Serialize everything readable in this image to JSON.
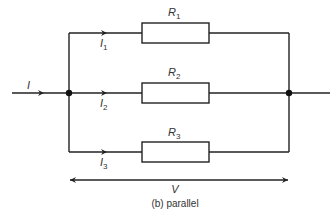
{
  "diagram": {
    "caption": "(b) parallel",
    "input_current": "I",
    "voltage": "V",
    "branches": [
      {
        "resistor": "R",
        "resistor_sub": "1",
        "current": "I",
        "current_sub": "1"
      },
      {
        "resistor": "R",
        "resistor_sub": "2",
        "current": "I",
        "current_sub": "2"
      },
      {
        "resistor": "R",
        "resistor_sub": "3",
        "current": "I",
        "current_sub": "3"
      }
    ],
    "colors": {
      "line": "#222222",
      "text": "#333333",
      "background": "#ffffff"
    }
  }
}
